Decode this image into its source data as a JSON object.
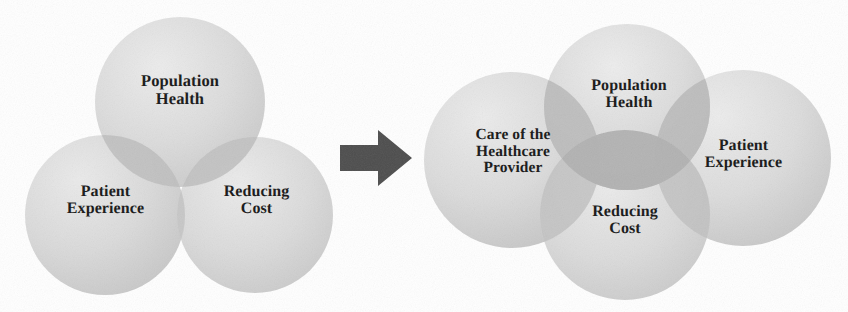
{
  "figure": {
    "kind": "venn-comparison-diagram",
    "colors": {
      "circle_fill": "#d9d9d9",
      "circle_fill_light": "#e8e8e8",
      "circle_fill_dark": "#c6c6c6",
      "overlap_fill": "#b6b6b6",
      "overlap_fill_deep": "#a8a8a8",
      "text": "#161616",
      "arrow": "#4a4a4a",
      "background": "#ffffff"
    }
  },
  "diagram_before": {
    "name": "Triple Aim",
    "circles": [
      {
        "id": "population-health",
        "label": "Population\nHealth",
        "cx": 180,
        "cy": 102,
        "r": 85
      },
      {
        "id": "patient-experience",
        "label": "Patient\nExperience",
        "cx": 105,
        "cy": 215,
        "r": 80
      },
      {
        "id": "reducing-cost",
        "label": "Reducing\nCost",
        "cx": 255,
        "cy": 215,
        "r": 78
      }
    ]
  },
  "transition": {
    "icon": "right-arrow-icon",
    "label": "leads to"
  },
  "diagram_after": {
    "name": "Quadruple Aim",
    "circles": [
      {
        "id": "population-health",
        "label": "Population\nHealth",
        "cx": 213,
        "cy": 107,
        "r": 83
      },
      {
        "id": "care-of-the-healthcare-provider",
        "label": "Care of the\nHealthcare\nProvider",
        "cx": 98,
        "cy": 160,
        "r": 88
      },
      {
        "id": "patient-experience",
        "label": "Patient\nExperience",
        "cx": 329,
        "cy": 158,
        "r": 88
      },
      {
        "id": "reducing-cost",
        "label": "Reducing\nCost",
        "cx": 211,
        "cy": 215,
        "r": 85
      }
    ]
  }
}
